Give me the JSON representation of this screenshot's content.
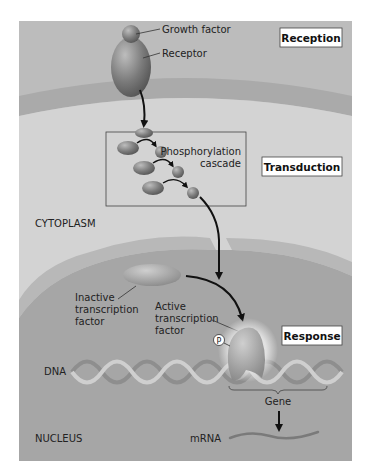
{
  "diagram": {
    "stages": {
      "reception": "Reception",
      "transduction": "Transduction",
      "response": "Response"
    },
    "labels": {
      "growth_factor": "Growth factor",
      "receptor": "Receptor",
      "cascade_line1": "Phosphorylation",
      "cascade_line2": "cascade",
      "cytoplasm": "CYTOPLASM",
      "inactive_tf_line1": "Inactive",
      "inactive_tf_line2": "transcription",
      "inactive_tf_line3": "factor",
      "active_tf_line1": "Active",
      "active_tf_line2": "transcription",
      "active_tf_line3": "factor",
      "phosphate": "P",
      "dna": "DNA",
      "gene": "Gene",
      "nucleus": "NUCLEUS",
      "mrna": "mRNA"
    },
    "colors": {
      "extracellular": "#b9b9b9",
      "membrane": "#a9a9a9",
      "cytoplasm": "#d2d2d2",
      "nuclear_envelope": "#b4b4b4",
      "nucleus": "#a5a5a5",
      "protein": "#7c7c7c",
      "arrow": "#111111"
    }
  }
}
